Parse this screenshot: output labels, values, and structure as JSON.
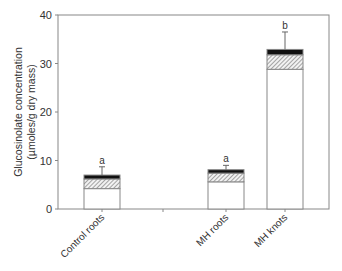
{
  "chart_data": {
    "type": "bar",
    "stacked": true,
    "title": "",
    "xlabel": "",
    "ylabel": "Glucosinolate concentration",
    "ylabel_units": "(µmoles/g dry mass)",
    "ylim": [
      0,
      40
    ],
    "yticks": [
      "0",
      "10",
      "20",
      "30",
      "40"
    ],
    "grid": false,
    "legend": null,
    "categories": [
      "Control roots",
      "MH roots",
      "MH knots"
    ],
    "series": [
      {
        "name": "white segment",
        "fill": "#ffffff",
        "values": [
          4.2,
          5.6,
          28.8
        ]
      },
      {
        "name": "hatched segment",
        "fill": "hatched",
        "values": [
          2.0,
          1.8,
          3.0
        ]
      },
      {
        "name": "black segment",
        "fill": "#111111",
        "values": [
          0.8,
          0.7,
          1.1
        ]
      }
    ],
    "totals": [
      7.0,
      8.1,
      32.9
    ],
    "error_bar_tops": [
      8.7,
      9.0,
      36.5
    ],
    "significance_letters": [
      "a",
      "a",
      "b"
    ]
  }
}
